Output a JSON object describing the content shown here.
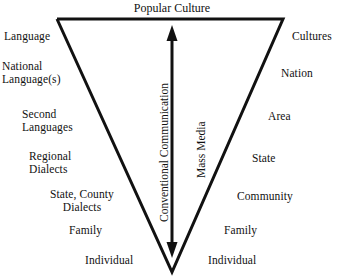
{
  "diagram": {
    "title": "Popular Culture",
    "axis_labels": {
      "left_vertical": "Conventional Communication",
      "right_vertical": "Mass Media"
    },
    "left_column": [
      {
        "text": "Language"
      },
      {
        "text": "National\nLanguage(s)",
        "line1": "National",
        "line2": "Language(s)"
      },
      {
        "text": "Second\nLanguages",
        "line1": "Second",
        "line2": "Languages"
      },
      {
        "text": "Regional\nDialects",
        "line1": "Regional",
        "line2": "Dialects"
      },
      {
        "text": "State, County\nDialects",
        "line1": "State, County",
        "line2": "Dialects"
      },
      {
        "text": "Family"
      },
      {
        "text": "Individual"
      }
    ],
    "right_column": [
      {
        "text": "Cultures"
      },
      {
        "text": "Nation"
      },
      {
        "text": "Area"
      },
      {
        "text": "State"
      },
      {
        "text": "Community"
      },
      {
        "text": "Family"
      },
      {
        "text": "Individual"
      }
    ],
    "shape": {
      "kind": "inverted-triangle",
      "stroke_color": "#111111",
      "stroke_width": 3,
      "top_left": [
        57,
        19
      ],
      "top_right": [
        283,
        19
      ],
      "apex": [
        172,
        272
      ]
    },
    "arrow": {
      "kind": "double-headed-vertical",
      "color": "#111111",
      "top": [
        172,
        28
      ],
      "bottom": [
        172,
        255
      ]
    },
    "background_color": "#ffffff"
  }
}
